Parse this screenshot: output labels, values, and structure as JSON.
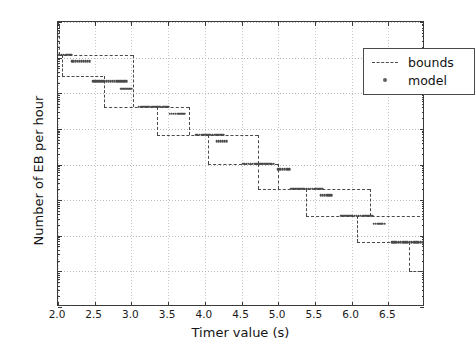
{
  "chart_data": {
    "type": "line",
    "title": "",
    "xlabel": "Timer value (s)",
    "ylabel": "Number of EB per hour",
    "xlim": [
      2.0,
      7.0
    ],
    "ylim": [
      1e-05,
      1000
    ],
    "yscale": "log",
    "grid": true,
    "legend_position": "upper right",
    "xticks": [
      2.0,
      2.5,
      3.0,
      3.5,
      4.0,
      4.5,
      5.0,
      5.5,
      6.0,
      6.5
    ],
    "xticklabels": [
      "2.0",
      "2.5",
      "3.0",
      "3.5",
      "4.0",
      "4.5",
      "5.0",
      "5.5",
      "6.0",
      "6.5"
    ],
    "yticks": [
      1e-05,
      0.0001,
      0.001,
      0.01,
      0.1,
      1,
      10,
      100,
      1000
    ],
    "yticklabels": [
      "10-5",
      "10-4",
      "10-3",
      "10-2",
      "10-1",
      "10 0",
      "10 1",
      "10 2",
      "10 3"
    ],
    "yticklabel_mant": [
      "10",
      "10",
      "10",
      "10",
      "10",
      "10",
      "10",
      "10",
      "10"
    ],
    "yticklabel_exp": [
      "-5",
      "-4",
      "-3",
      "-2",
      "-1",
      "0",
      "1",
      "2",
      "3"
    ],
    "series": [
      {
        "name": "bounds",
        "style": "dashed-step",
        "description": "Upper and lower staircase bounds forming nested step bands",
        "segments": [
          {
            "kind": "vertical",
            "x": 2.02,
            "y0": 800.0,
            "y1": 120.0
          },
          {
            "kind": "vertical",
            "x": 2.06,
            "y0": 120.0,
            "y1": 30.0
          },
          {
            "kind": "horizontal",
            "y": 120.0,
            "x0": 2.02,
            "x1": 3.02
          },
          {
            "kind": "vertical",
            "x": 3.02,
            "y0": 120.0,
            "y1": 4.2
          },
          {
            "kind": "horizontal",
            "y": 30.0,
            "x0": 2.06,
            "x1": 2.62
          },
          {
            "kind": "vertical",
            "x": 2.62,
            "y0": 30.0,
            "y1": 4.2
          },
          {
            "kind": "horizontal",
            "y": 4.2,
            "x0": 2.62,
            "x1": 3.78
          },
          {
            "kind": "vertical",
            "x": 3.35,
            "y0": 4.2,
            "y1": 0.68
          },
          {
            "kind": "vertical",
            "x": 3.78,
            "y0": 4.2,
            "y1": 0.68
          },
          {
            "kind": "horizontal",
            "y": 0.68,
            "x0": 3.35,
            "x1": 4.72
          },
          {
            "kind": "vertical",
            "x": 4.05,
            "y0": 0.68,
            "y1": 0.105
          },
          {
            "kind": "vertical",
            "x": 4.72,
            "y0": 0.68,
            "y1": 0.105
          },
          {
            "kind": "horizontal",
            "y": 0.105,
            "x0": 4.05,
            "x1": 5.0
          },
          {
            "kind": "vertical",
            "x": 4.72,
            "y0": 0.105,
            "y1": 0.021
          },
          {
            "kind": "vertical",
            "x": 5.0,
            "y0": 0.105,
            "y1": 0.021
          },
          {
            "kind": "horizontal",
            "y": 0.021,
            "x0": 4.72,
            "x1": 6.25
          },
          {
            "kind": "vertical",
            "x": 5.38,
            "y0": 0.021,
            "y1": 0.0037
          },
          {
            "kind": "vertical",
            "x": 6.25,
            "y0": 0.021,
            "y1": 0.0037
          },
          {
            "kind": "horizontal",
            "y": 0.0037,
            "x0": 5.38,
            "x1": 7.0
          },
          {
            "kind": "vertical",
            "x": 6.08,
            "y0": 0.0037,
            "y1": 0.00065
          },
          {
            "kind": "horizontal",
            "y": 0.00065,
            "x0": 6.08,
            "x1": 7.0
          },
          {
            "kind": "vertical",
            "x": 6.78,
            "y0": 0.00065,
            "y1": 0.0001
          },
          {
            "kind": "horizontal",
            "y": 0.0001,
            "x0": 6.78,
            "x1": 7.0
          }
        ]
      },
      {
        "name": "model",
        "style": "points",
        "description": "Model prediction sampled as clustered dot runs stepping down by ~decade",
        "points": [
          {
            "x0": 2.0,
            "x1": 2.18,
            "y": 120.0,
            "n": 8
          },
          {
            "x0": 2.19,
            "x1": 2.43,
            "y": 78.0,
            "n": 10
          },
          {
            "x0": 2.48,
            "x1": 2.93,
            "y": 22.0,
            "n": 18
          },
          {
            "x0": 2.86,
            "x1": 3.0,
            "y": 13.5,
            "n": 6
          },
          {
            "x0": 3.1,
            "x1": 3.5,
            "y": 4.2,
            "n": 17
          },
          {
            "x0": 3.52,
            "x1": 3.72,
            "y": 2.7,
            "n": 8
          },
          {
            "x0": 3.88,
            "x1": 4.26,
            "y": 0.68,
            "n": 16
          },
          {
            "x0": 4.16,
            "x1": 4.3,
            "y": 0.45,
            "n": 6
          },
          {
            "x0": 4.52,
            "x1": 4.94,
            "y": 0.105,
            "n": 17
          },
          {
            "x0": 5.0,
            "x1": 5.15,
            "y": 0.075,
            "n": 6
          },
          {
            "x0": 5.18,
            "x1": 5.6,
            "y": 0.021,
            "n": 17
          },
          {
            "x0": 5.58,
            "x1": 5.72,
            "y": 0.0135,
            "n": 6
          },
          {
            "x0": 5.86,
            "x1": 6.28,
            "y": 0.0037,
            "n": 17
          },
          {
            "x0": 6.3,
            "x1": 6.45,
            "y": 0.0022,
            "n": 6
          },
          {
            "x0": 6.55,
            "x1": 7.0,
            "y": 0.00065,
            "n": 16
          }
        ]
      }
    ]
  },
  "legend": {
    "entries": [
      {
        "label": "bounds",
        "key": "dashed-line"
      },
      {
        "label": "model",
        "key": "dot-marker"
      }
    ]
  },
  "colors": {
    "line": "#4a4a4a",
    "marker": "#4a4a4a",
    "axis": "#3a3a3a",
    "grid": "#c9c9c9",
    "background": "#ffffff",
    "text": "#111111"
  }
}
